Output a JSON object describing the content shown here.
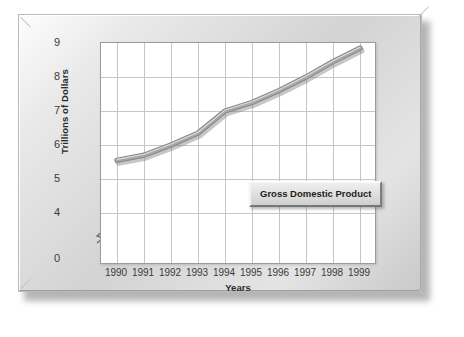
{
  "chart_data": {
    "type": "line",
    "title": "",
    "xlabel": "Years",
    "ylabel": "Trillions of Dollars",
    "categories": [
      "1990",
      "1991",
      "1992",
      "1993",
      "1994",
      "1995",
      "1996",
      "1997",
      "1998",
      "1999"
    ],
    "x": [
      1990,
      1991,
      1992,
      1993,
      1994,
      1995,
      1996,
      1997,
      1998,
      1999
    ],
    "series": [
      {
        "name": "Gross Domestic Product",
        "values": [
          5.55,
          5.7,
          6.0,
          6.35,
          7.0,
          7.25,
          7.6,
          8.0,
          8.45,
          8.85
        ]
      }
    ],
    "ylim": [
      0,
      9
    ],
    "yticks": [
      "0",
      "4",
      "5",
      "6",
      "7",
      "8",
      "9"
    ],
    "ytick_values": [
      0,
      4,
      5,
      6,
      7,
      8,
      9
    ],
    "y_axis_broken": true,
    "y_break_between": [
      0,
      4
    ],
    "grid": true,
    "legend_position": "inside-lower-right",
    "line_color": "#8f8f8f",
    "line_highlight_color": "#d8d8d8",
    "grid_color": "#c6c6c6",
    "plot_background": "#ffffff",
    "frame_color": "#d3d3d3"
  },
  "legend": {
    "label": "Gross Domestic Product"
  },
  "axes": {
    "y_title": "Trillions of Dollars",
    "x_title": "Years",
    "y_ticks": [
      "9",
      "8",
      "7",
      "6",
      "5",
      "4",
      "0"
    ],
    "x_ticks": [
      "1990",
      "1991",
      "1992",
      "1993",
      "1994",
      "1995",
      "1996",
      "1997",
      "1998",
      "1999"
    ]
  }
}
